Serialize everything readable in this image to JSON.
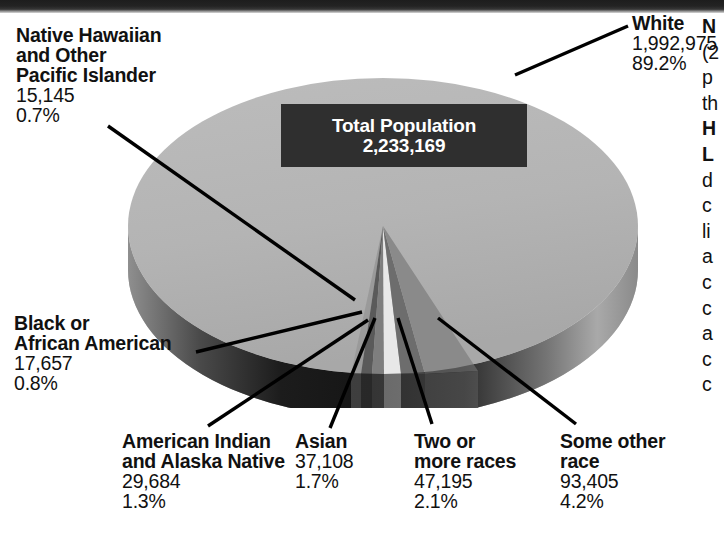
{
  "chart_data": {
    "type": "pie",
    "title": "Total Population",
    "total_label": "Total Population",
    "total_value": "2,233,169",
    "categories": [
      "White",
      "Some other race",
      "Two or more races",
      "Asian",
      "American Indian and Alaska Native",
      "Black or African American",
      "Native Hawaiian and Other Pacific Islander"
    ],
    "values": [
      1992975,
      93405,
      47195,
      37108,
      29684,
      17657,
      15145
    ],
    "percents": [
      89.2,
      4.2,
      2.1,
      1.7,
      1.3,
      0.8,
      0.7
    ],
    "xlabel": "",
    "ylabel": "",
    "legend_position": "callouts",
    "grid": false,
    "slices": [
      {
        "name": "White",
        "value": "1,992,975",
        "percent": "89.2%",
        "color": "#b4b4b4"
      },
      {
        "name": "Some other race",
        "value": "93,405",
        "percent": "4.2%",
        "color": "#8a8a8a"
      },
      {
        "name": "Two or more races",
        "value": "47,195",
        "percent": "2.1%",
        "color": "#6d6d6d"
      },
      {
        "name": "Asian",
        "value": "37,108",
        "percent": "1.7%",
        "color": "#e8e8e8"
      },
      {
        "name": "American Indian and Alaska Native",
        "value": "29,684",
        "percent": "1.3%",
        "color": "#7e7e7e"
      },
      {
        "name": "Black or African American",
        "value": "17,657",
        "percent": "0.8%",
        "color": "#5a5a5a"
      },
      {
        "name": "Native Hawaiian and Other Pacific Islander",
        "value": "15,145",
        "percent": "0.7%",
        "color": "#9a9a9a"
      }
    ]
  },
  "center": {
    "title": "Total Population",
    "value": "2,233,169"
  },
  "labels": {
    "nhpi": {
      "line1": "Native Hawaiian",
      "line2": "and Other",
      "line3": "Pacific Islander",
      "value": "15,145",
      "percent": "0.7%"
    },
    "black": {
      "line1": "Black or",
      "line2": "African American",
      "value": "17,657",
      "percent": "0.8%"
    },
    "white": {
      "line1": "White",
      "value": "1,992,975",
      "percent": "89.2%"
    },
    "aian": {
      "line1": "American Indian",
      "line2": "and Alaska Native",
      "value": "29,684",
      "percent": "1.3%"
    },
    "asian": {
      "line1": "Asian",
      "value": "37,108",
      "percent": "1.7%"
    },
    "two_or_more": {
      "line1": "Two or",
      "line2": "more races",
      "value": "47,195",
      "percent": "2.1%"
    },
    "some_other": {
      "line1": "Some other",
      "line2": "race",
      "value": "93,405",
      "percent": "4.2%"
    }
  },
  "side_column": {
    "note": "text column clipped by the right edge of the image; only first glyphs visible",
    "lines": [
      {
        "text": "N",
        "bold": true
      },
      {
        "text": "(2",
        "bold": false
      },
      {
        "text": "p",
        "bold": false
      },
      {
        "text": "th",
        "bold": false
      },
      {
        "text": "H",
        "bold": true
      },
      {
        "text": "L",
        "bold": true
      },
      {
        "text": "d",
        "bold": false
      },
      {
        "text": "c",
        "bold": false
      },
      {
        "text": "li",
        "bold": false
      },
      {
        "text": "a",
        "bold": false
      },
      {
        "text": "c",
        "bold": false
      },
      {
        "text": "c",
        "bold": false
      },
      {
        "text": "a",
        "bold": false
      },
      {
        "text": "c",
        "bold": false
      },
      {
        "text": "c",
        "bold": false
      }
    ]
  },
  "colors": {
    "background": "#ffffff",
    "text": "#111111",
    "callout_box_bg": "#2f2f2f",
    "callout_box_text": "#ffffff",
    "pie_top_major": "#b4b4b4",
    "pie_side_dark": "#262626",
    "leader_line": "#000000"
  }
}
